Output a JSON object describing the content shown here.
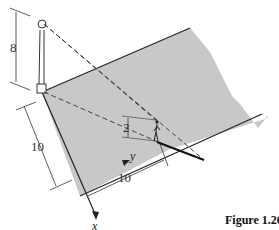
{
  "figure": {
    "caption": "Figure 1.26",
    "labels": {
      "pole_height": "8",
      "left_distance": "10",
      "bottom_distance": "10",
      "person_height": "2",
      "x_axis": "x",
      "y_axis": "y"
    },
    "colors": {
      "ground_fill": "#c8c8c8",
      "line": "#222222",
      "background": "#ffffff"
    }
  }
}
